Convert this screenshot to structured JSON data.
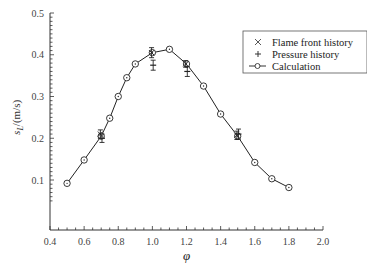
{
  "chart_data": {
    "type": "line",
    "title": "",
    "xlabel": "φ",
    "ylabel": "s_L/(m/s)",
    "xlim": [
      0.4,
      2.0
    ],
    "ylim": [
      0.05,
      0.5
    ],
    "xticks": [
      "0.4",
      "0.6",
      "0.8",
      "1.0",
      "1.2",
      "1.4",
      "1.6",
      "1.8",
      "2.0"
    ],
    "yticks": [
      "0.1",
      "0.2",
      "0.3",
      "0.4",
      "0.5"
    ],
    "grid": false,
    "legend_position": "upper right",
    "legend": [
      "Flame front history",
      "Pressure history",
      "Calculation"
    ],
    "series": [
      {
        "name": "Calculation",
        "marker": "circle-line",
        "x": [
          0.5,
          0.6,
          0.7,
          0.75,
          0.8,
          0.85,
          0.9,
          1.0,
          1.1,
          1.2,
          1.3,
          1.4,
          1.5,
          1.6,
          1.7,
          1.8
        ],
        "y": [
          0.092,
          0.148,
          0.205,
          0.248,
          0.3,
          0.345,
          0.378,
          0.405,
          0.413,
          0.378,
          0.325,
          0.258,
          0.205,
          0.142,
          0.103,
          0.082
        ]
      },
      {
        "name": "Flame front history",
        "marker": "x",
        "x": [
          0.7,
          1.0,
          1.2,
          1.5
        ],
        "y": [
          0.21,
          0.405,
          0.378,
          0.207
        ],
        "err": [
          0.01,
          0.012,
          0.008,
          0.01
        ]
      },
      {
        "name": "Pressure history",
        "marker": "+",
        "x": [
          0.7,
          1.0,
          1.2,
          1.5
        ],
        "y": [
          0.2,
          0.375,
          0.36,
          0.21
        ],
        "err": [
          0.01,
          0.012,
          0.012,
          0.012
        ]
      }
    ]
  }
}
